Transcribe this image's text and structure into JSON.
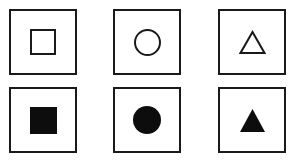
{
  "canvas": {
    "width": 295,
    "height": 165,
    "background_color": "#ffffff",
    "stroke_color": "#1a1a1a",
    "fill_color": "#0d0d0d"
  },
  "figure": {
    "title": "",
    "rows": [
      {
        "row_label": "outline",
        "cells": [
          {
            "shape": "square",
            "style": "outline",
            "icon_name": "square-outline-icon"
          },
          {
            "shape": "circle",
            "style": "outline",
            "icon_name": "circle-outline-icon"
          },
          {
            "shape": "triangle",
            "style": "outline",
            "icon_name": "triangle-outline-icon"
          }
        ]
      },
      {
        "row_label": "filled",
        "cells": [
          {
            "shape": "square",
            "style": "filled",
            "icon_name": "square-filled-icon"
          },
          {
            "shape": "circle",
            "style": "filled",
            "icon_name": "circle-filled-icon"
          },
          {
            "shape": "triangle",
            "style": "filled",
            "icon_name": "triangle-filled-icon"
          }
        ]
      }
    ]
  }
}
